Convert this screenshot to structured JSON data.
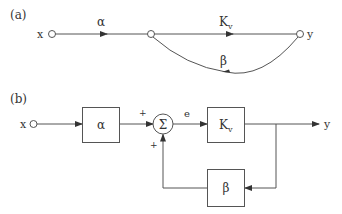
{
  "diagram": {
    "part_a": {
      "label": "(a)",
      "input_label": "x",
      "output_label": "y",
      "forward_gain_1": "α",
      "forward_gain_2": "K",
      "forward_gain_2_sub": "v",
      "feedback_gain": "β"
    },
    "part_b": {
      "label": "(b)",
      "input_label": "x",
      "output_label": "y",
      "block_alpha": "α",
      "summing_symbol": "Σ",
      "sum_input_top_sign": "+",
      "sum_input_bottom_sign": "+",
      "error_label": "e",
      "block_forward": "K",
      "block_forward_sub": "v",
      "block_feedback": "β"
    }
  },
  "colors": {
    "line": "#555555",
    "text": "#333333",
    "background": "#ffffff"
  }
}
